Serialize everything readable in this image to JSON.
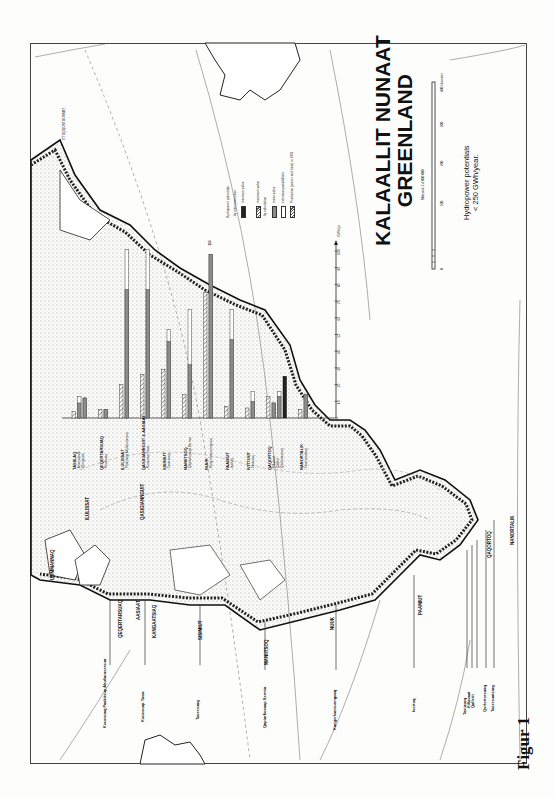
{
  "figure": {
    "caption": "Figur 1",
    "map_title_line1": "KALAALLIT NUNAAT",
    "map_title_line2": "GREENLAND",
    "scale_text": "Målestok 1:4 000 000",
    "scale_ticks": [
      "0",
      "100",
      "200",
      "300",
      "400 kilometer"
    ],
    "subtitle_line1": "Hydropower potentials",
    "subtitle_line2": "< 250 GWh/year.",
    "north_label": "ITTOQQORTOORMIIT",
    "east_labels": [
      "Ammassalik",
      "AMMASSALIK",
      "Ammassaliip Qoorua"
    ],
    "grid_labels": [
      "65°",
      "60°",
      "55°",
      "50°",
      "45°",
      "70°",
      "40°",
      "75°"
    ]
  },
  "legend": {
    "title": "Hydropower potentials:",
    "items": [
      {
        "label": "- by interconnection",
        "swatch": "none"
      },
      {
        "label": "minimum value",
        "swatch": "solid-dark"
      },
      {
        "label": "maximum value",
        "swatch": "hatched"
      },
      {
        "label": "- by calculation",
        "swatch": "none"
      },
      {
        "label": "mean value",
        "swatch": "solid-grey"
      },
      {
        "label": "extension possibilities",
        "swatch": "white"
      },
      {
        "label": "Production (power and heat) in 1991",
        "swatch": "hatched"
      }
    ]
  },
  "coast_towns": [
    "UUMMANNAQ",
    "ILULISSAT",
    "QASIGIANNGUIT",
    "QEQERTARSUAQ",
    "AASIAAT",
    "KANGAATSIAQ",
    "SISIMIUT",
    "MANIITSOQ",
    "NUUK",
    "PAAMIUT",
    "QAQORTOQ",
    "NANORTALIK"
  ],
  "site_labels": [
    "Kuussuaq Paakitsup Akuliarusersua",
    "Kuussuup Tasia",
    "Tasersuaq",
    "Qapiarfiusaap Sermia",
    "Kangerluarsunnguaq",
    "Isortoq",
    "Tasiusaq",
    "Killavaat",
    "Qallerit",
    "Qorlortorsuaq",
    "Tasersuatsiaq"
  ],
  "chart_data": {
    "type": "bar",
    "title": "Hydropower potentials < 250 GWh/year",
    "ylabel": "GWh/yr",
    "ylim": [
      0,
      110
    ],
    "yticks": [
      10,
      20,
      30,
      40,
      50,
      60,
      70,
      80,
      90,
      100
    ],
    "annotation": "116",
    "groups": [
      {
        "town": "TASIILAQ",
        "sites": [
          "Ammassalik",
          "Qinnguata"
        ],
        "production": 4,
        "bars": [
          {
            "site": "Ammassalik",
            "mean": 9,
            "extension": 13
          },
          {
            "site": "Qinnguata",
            "mean": 12,
            "extension": 12
          }
        ]
      },
      {
        "town": "QEQERTARSUAQ",
        "sites": [
          "Kuussuaq"
        ],
        "production": 5,
        "bars": [
          {
            "site": "Kuussuaq",
            "mean": 5,
            "extension": 5
          }
        ]
      },
      {
        "town": "ILULISSAT",
        "sites": [
          "Paakitsup Akuliarusersua"
        ],
        "production": 20,
        "bars": [
          {
            "site": "Paakitsup Akuliarusersua",
            "mean": 77,
            "extension": 101
          }
        ]
      },
      {
        "town": "QASIGIANNGUIT & AASIAAT",
        "sites": [
          "Kuussuup Tasia"
        ],
        "production": 26,
        "bars": [
          {
            "site": "Kuussuup Tasia",
            "mean": 77,
            "extension": 101
          }
        ]
      },
      {
        "town": "SISIMIUT",
        "sites": [
          "Tasersuaq"
        ],
        "production": 29,
        "bars": [
          {
            "site": "Tasersuaq",
            "mean": 46,
            "extension": 53
          }
        ]
      },
      {
        "town": "MANIITSOQ",
        "sites": [
          "Qapiarfiusaap Sermia"
        ],
        "production": 14,
        "bars": [
          {
            "site": "Qapiarfiusaap Sermia",
            "mean": 32,
            "extension": 65
          }
        ]
      },
      {
        "town": "NUUK",
        "sites": [
          "Kangerluarsunnguaq"
        ],
        "production": 75,
        "bars": [
          {
            "site": "Kangerluarsunnguaq",
            "mean": 98,
            "extension": 98
          }
        ]
      },
      {
        "town": "PAAMIUT",
        "sites": [
          "Isortoq"
        ],
        "production": 7,
        "bars": [
          {
            "site": "Isortoq",
            "mean": 47,
            "extension": 65
          }
        ]
      },
      {
        "town": "IVITTUUT",
        "sites": [
          "Tasiusaq"
        ],
        "production": 6,
        "bars": [
          {
            "site": "Tasiusaq",
            "mean": 10,
            "extension": 16
          }
        ]
      },
      {
        "town": "QAQORTOQ",
        "sites": [
          "Killavaat",
          "Qallerit",
          "Qorlortorsuaq"
        ],
        "production": 13,
        "bars": [
          {
            "site": "Killavaat",
            "mean": 9,
            "extension": 9
          },
          {
            "site": "Qallerit",
            "mean": 13,
            "extension": 16
          },
          {
            "site": "Qorlortorsuaq",
            "min": 25,
            "max": 25
          }
        ]
      },
      {
        "town": "NANORTALIK",
        "sites": [
          "Tasersuatsiaq"
        ],
        "production": 5,
        "bars": [
          {
            "site": "Tasersuatsiaq",
            "mean": 14,
            "extension": 14
          }
        ]
      }
    ]
  }
}
